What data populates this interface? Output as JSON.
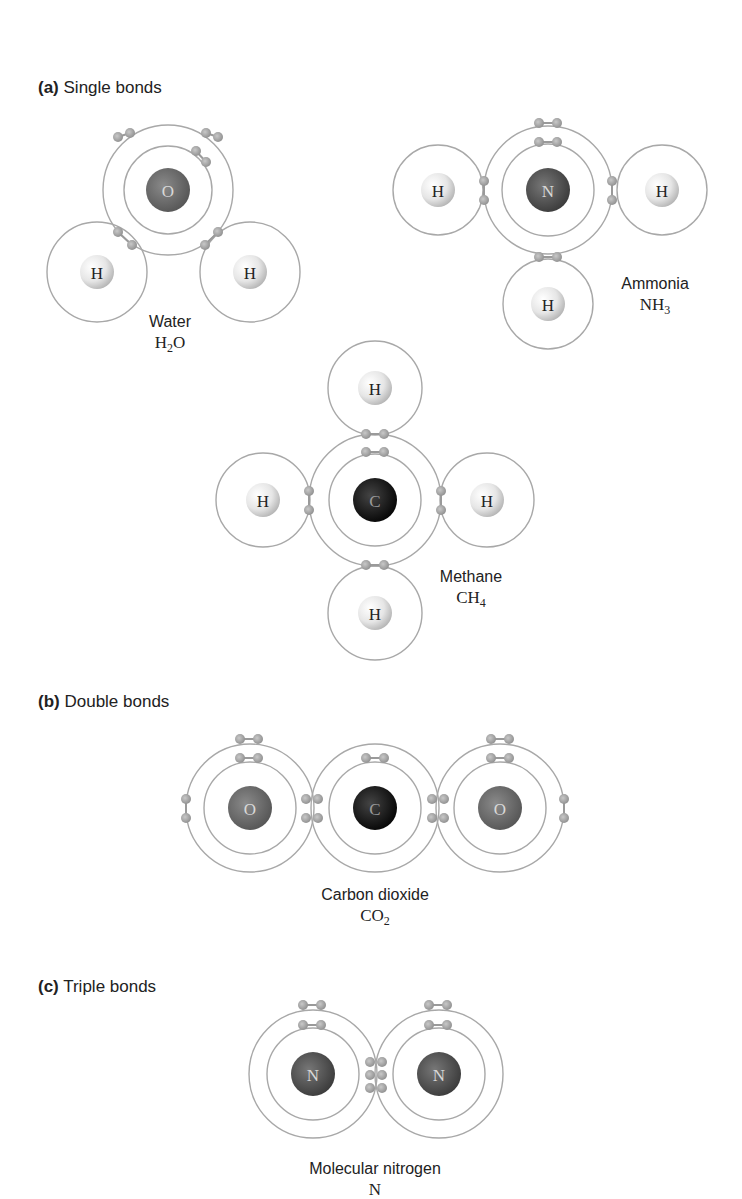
{
  "sections": {
    "a": {
      "letter": "(a)",
      "title": "Single bonds"
    },
    "b": {
      "letter": "(b)",
      "title": "Double bonds"
    },
    "c": {
      "letter": "(c)",
      "title": "Triple bonds"
    }
  },
  "molecules": {
    "water": {
      "name": "Water",
      "formula_base": "H",
      "formula_sub": "2",
      "formula_tail": "O",
      "atoms": [
        "O",
        "H",
        "H"
      ]
    },
    "ammonia": {
      "name": "Ammonia",
      "formula_base": "NH",
      "formula_sub": "3",
      "atoms": [
        "N",
        "H",
        "H",
        "H"
      ]
    },
    "methane": {
      "name": "Methane",
      "formula_base": "CH",
      "formula_sub": "4",
      "atoms": [
        "C",
        "H",
        "H",
        "H",
        "H"
      ]
    },
    "carbon_dioxide": {
      "name": "Carbon dioxide",
      "formula_base": "CO",
      "formula_sub": "2",
      "atoms": [
        "O",
        "C",
        "O"
      ]
    },
    "nitrogen": {
      "name": "Molecular nitrogen",
      "formula_base": "N",
      "atoms": [
        "N",
        "N"
      ]
    }
  },
  "colors": {
    "orbit": "#a8a8a8",
    "electron": "#9a9a9a",
    "oxygen": "#6e6e6e",
    "nitrogen": "#555555",
    "carbon": "#1a1a1a",
    "hydrogen": "#e4e4e4"
  }
}
